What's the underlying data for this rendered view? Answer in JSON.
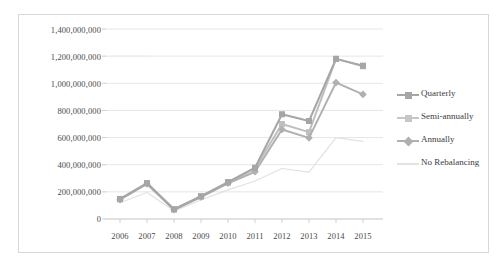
{
  "chart_data": {
    "type": "line",
    "title": "",
    "xlabel": "",
    "ylabel": "",
    "categories": [
      "2006",
      "2007",
      "2008",
      "2009",
      "2010",
      "2011",
      "2012",
      "2013",
      "2014",
      "2015"
    ],
    "ylim": [
      0,
      1400000000
    ],
    "ytick_values": [
      0,
      200000000,
      400000000,
      600000000,
      800000000,
      1000000000,
      1200000000,
      1400000000
    ],
    "ytick_labels": [
      "0",
      "200,000,000",
      "400,000,000",
      "600,000,000",
      "800,000,000",
      "1,000,000,000",
      "1,200,000,000",
      "1,400,000,000"
    ],
    "grid": true,
    "grid_axis": "y",
    "legend_position": "right",
    "series": [
      {
        "name": "Quarterly",
        "marker": "square",
        "color": "#a6a6a6",
        "values": [
          148000000,
          265000000,
          72000000,
          168000000,
          272000000,
          378000000,
          772000000,
          722000000,
          1180000000,
          1130000000
        ]
      },
      {
        "name": "Semi-annually",
        "marker": "square",
        "color": "#bfbfbf",
        "values": [
          145000000,
          262000000,
          70000000,
          165000000,
          268000000,
          372000000,
          700000000,
          640000000,
          1180000000,
          1125000000
        ]
      },
      {
        "name": "Annually",
        "marker": "diamond",
        "color": "#b0b0b0",
        "values": [
          142000000,
          258000000,
          68000000,
          162000000,
          263000000,
          348000000,
          660000000,
          598000000,
          1005000000,
          918000000
        ]
      },
      {
        "name": "No Rebalancing",
        "marker": "none",
        "color": "#e2e2e2",
        "values": [
          120000000,
          195000000,
          60000000,
          140000000,
          215000000,
          280000000,
          372000000,
          345000000,
          600000000,
          572000000
        ]
      }
    ]
  },
  "legend": {
    "items": [
      {
        "label": "Quarterly"
      },
      {
        "label": "Semi-annually"
      },
      {
        "label": "Annually"
      },
      {
        "label": "No Rebalancing"
      }
    ]
  },
  "colors": {
    "frame_border": "#d8d8d8",
    "gridline": "#e6e6e6",
    "axis_text": "#4a4a4a",
    "background": "#ffffff"
  }
}
